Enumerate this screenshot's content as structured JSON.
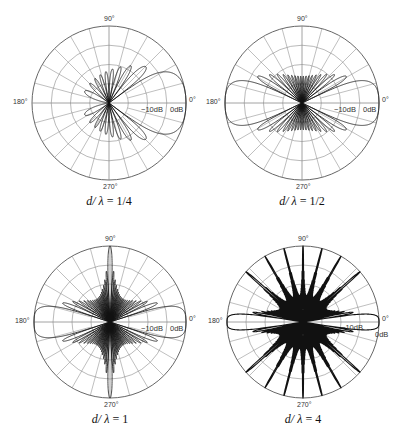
{
  "chart_data": [
    {
      "type": "polar",
      "title": "d/λ = 1/4",
      "caption_var": "d/ λ",
      "caption_value": "= 1/4",
      "d_over_lambda": 0.25,
      "main_lobe_directions_deg": [
        0
      ],
      "angle_labels": {
        "0": "0°",
        "90": "90°",
        "180": "180°",
        "270": "270°"
      },
      "radial_labels": [
        "−10dB",
        "0dB"
      ],
      "rings": 4,
      "radial_line_spacing_deg": 15,
      "center": [
        109,
        103
      ],
      "radius": 77
    },
    {
      "type": "polar",
      "title": "d/λ = 1/2",
      "caption_var": "d/ λ",
      "caption_value": "= 1/2",
      "d_over_lambda": 0.5,
      "main_lobe_directions_deg": [
        0,
        180
      ],
      "angle_labels": {
        "0": "0°",
        "90": "90°",
        "180": "180°",
        "270": "270°"
      },
      "radial_labels": [
        "−10dB",
        "0dB"
      ],
      "rings": 4,
      "radial_line_spacing_deg": 15,
      "center": [
        302,
        103
      ],
      "radius": 77
    },
    {
      "type": "polar",
      "title": "d/λ = 1",
      "caption_var": "d/ λ",
      "caption_value": "= 1",
      "d_over_lambda": 1,
      "main_lobe_directions_deg": [
        0,
        90,
        180,
        270
      ],
      "angle_labels": {
        "0": "0°",
        "90": "90°",
        "180": "180°",
        "270": "270°"
      },
      "radial_labels": [
        "−10dB",
        "0dB"
      ],
      "rings": 4,
      "radial_line_spacing_deg": 15,
      "center": [
        110,
        322
      ],
      "radius": 76
    },
    {
      "type": "polar",
      "title": "d/λ = 4",
      "caption_var": "d/ λ",
      "caption_value": "= 4",
      "d_over_lambda": 4,
      "main_lobe_directions_deg": [
        0,
        180,
        "multiple grating lobes"
      ],
      "angle_labels": {
        "0": "0°",
        "90": "90°",
        "180": "180°",
        "270": "270°"
      },
      "radial_labels": [
        "−10dB",
        "0dB"
      ],
      "rings": 4,
      "radial_line_spacing_deg": 15,
      "center": [
        303,
        322
      ],
      "radius": 76
    }
  ],
  "pattern": {
    "elements": 20,
    "db_floor": -40,
    "db_range_top": 0,
    "mode": "endfire"
  },
  "style": {
    "grid_color": "#8a8a8a",
    "outer_ring_color": "#555555",
    "pattern_color": "#111111"
  }
}
